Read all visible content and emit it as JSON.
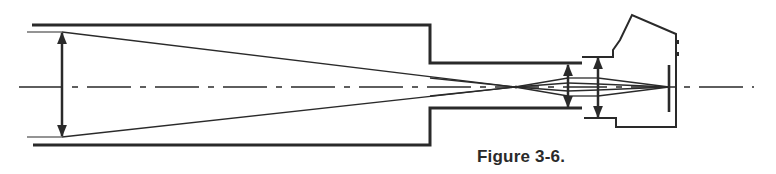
{
  "figure": {
    "caption": "Figure 3-6.",
    "colors": {
      "ink": "#2a2a2a",
      "background": "#ffffff"
    },
    "components": [
      {
        "name": "telescope-tube",
        "label": ""
      },
      {
        "name": "objective-lens",
        "label": ""
      },
      {
        "name": "eyepiece-lens",
        "label": ""
      },
      {
        "name": "camera-lens",
        "label": ""
      },
      {
        "name": "camera-body",
        "label": ""
      },
      {
        "name": "film-plane",
        "label": ""
      },
      {
        "name": "optical-axis",
        "label": ""
      }
    ]
  }
}
